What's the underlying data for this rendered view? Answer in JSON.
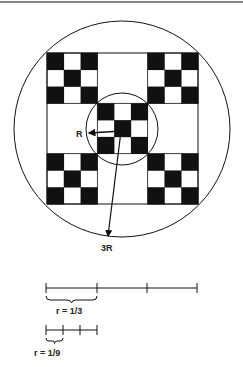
{
  "figure": {
    "labels": {
      "inner_radius": "R",
      "outer_radius": "3R",
      "scale_one_third": "r = 1/3",
      "scale_one_ninth": "r = 1/9"
    },
    "colors": {
      "ink": "#111111",
      "paper": "#ffffff"
    },
    "outer_circle": {
      "cx": 122,
      "cy": 129,
      "r": 108
    },
    "inner_circle": {
      "cx": 122,
      "cy": 129,
      "r": 36
    },
    "square": {
      "x": 47,
      "y": 53,
      "size": 151
    },
    "scale_bars": [
      {
        "y": 288,
        "ticks": [
          46,
          97,
          147,
          197
        ]
      },
      {
        "y": 330,
        "ticks": [
          46,
          63,
          80,
          97
        ]
      }
    ]
  }
}
